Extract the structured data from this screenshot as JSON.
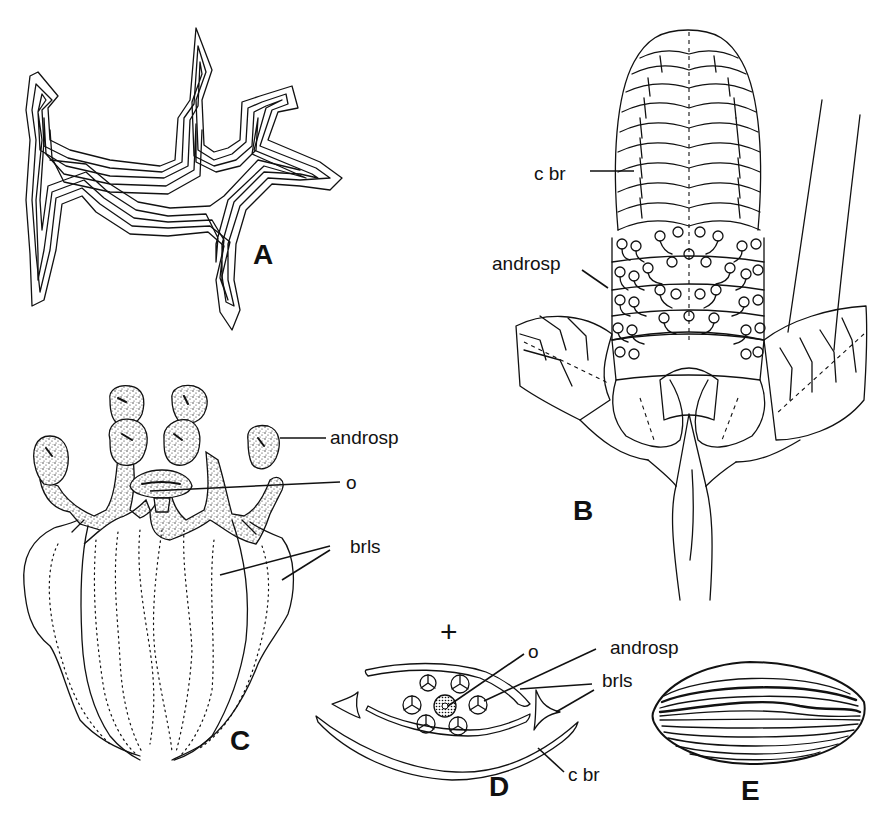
{
  "figure": {
    "background": "#ffffff",
    "ink_color": "#111111",
    "panels": [
      {
        "id": "A",
        "label": "A",
        "description": "contour outline of branched structure (multiple concentric lines)"
      },
      {
        "id": "B",
        "label": "B",
        "description": "strobilus / cone with bracts",
        "annotations": [
          {
            "text": "c br"
          },
          {
            "text": "androsp"
          }
        ]
      },
      {
        "id": "C",
        "label": "C",
        "description": "androsporangiophores with ovule and bracteoles",
        "annotations": [
          {
            "text": "androsp"
          },
          {
            "text": "o"
          },
          {
            "text": "brls"
          }
        ]
      },
      {
        "id": "D",
        "label": "D",
        "description": "floral diagram cross section",
        "symbol": "+",
        "annotations": [
          {
            "text": "o"
          },
          {
            "text": "androsp"
          },
          {
            "text": "brls"
          },
          {
            "text": "c br"
          }
        ]
      },
      {
        "id": "E",
        "label": "E",
        "description": "seed / pollen grain with striations"
      }
    ]
  }
}
